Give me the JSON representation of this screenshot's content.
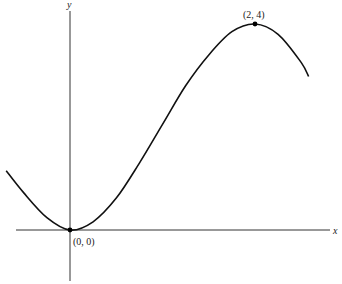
{
  "chart_data": {
    "type": "line",
    "title": "",
    "xlabel": "x",
    "ylabel": "y",
    "grid": false,
    "xlim": [
      -0.7,
      2.8
    ],
    "ylim": [
      -1.0,
      4.3
    ],
    "series": [
      {
        "name": "curve",
        "x": [
          -0.69,
          -0.5,
          -0.25,
          0,
          0.25,
          0.5,
          0.75,
          1.0,
          1.25,
          1.5,
          1.75,
          2.0,
          2.25,
          2.5,
          2.58
        ],
        "y": [
          1.15,
          0.72,
          0.24,
          0,
          0.16,
          0.62,
          1.3,
          2.05,
          2.8,
          3.4,
          3.85,
          4.0,
          3.8,
          3.25,
          2.98
        ]
      }
    ],
    "points": [
      {
        "x": 0,
        "y": 0,
        "label": "(0, 0)"
      },
      {
        "x": 2,
        "y": 4,
        "label": "(2, 4)"
      }
    ]
  }
}
